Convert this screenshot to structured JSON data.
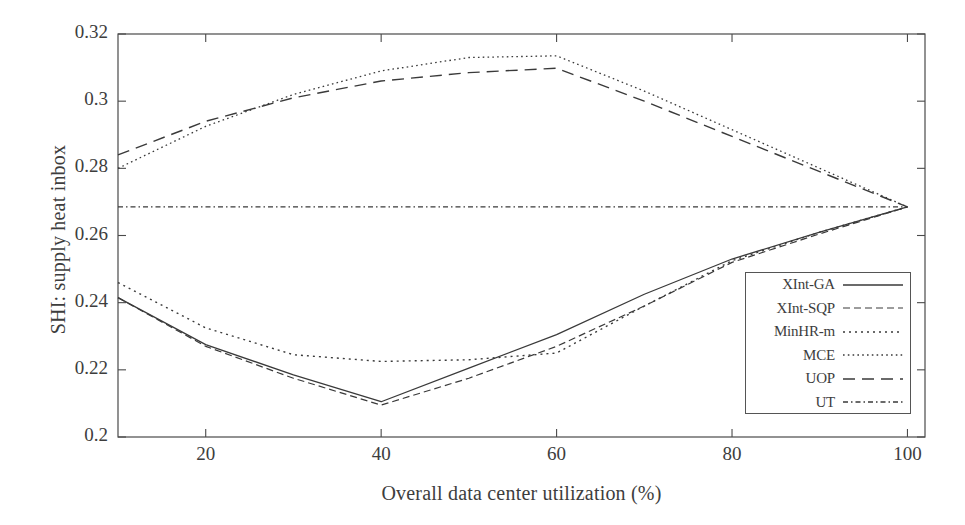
{
  "chart_data": {
    "type": "line",
    "title": "",
    "xlabel": "Overall data center utilization (%)",
    "ylabel": "SHI: supply heat inbox",
    "xlim": [
      10,
      102
    ],
    "ylim": [
      0.2,
      0.32
    ],
    "xticks": [
      20,
      40,
      60,
      80,
      100
    ],
    "yticks": [
      "0.2",
      "0.22",
      "0.24",
      "0.26",
      "0.28",
      "0.3",
      "0.32"
    ],
    "ytick_values": [
      0.2,
      0.22,
      0.24,
      0.26,
      0.28,
      0.3,
      0.32
    ],
    "grid": false,
    "legend_position": "lower-right-inside",
    "x": [
      10,
      20,
      30,
      40,
      50,
      60,
      70,
      80,
      90,
      100
    ],
    "series": [
      {
        "name": "XInt-GA",
        "style": "solid",
        "values": [
          0.2415,
          0.2275,
          0.2185,
          0.2105,
          0.2205,
          0.2305,
          0.2425,
          0.253,
          0.261,
          0.2685
        ]
      },
      {
        "name": "XInt-SQP",
        "style": "dashed",
        "values": [
          0.2415,
          0.227,
          0.2175,
          0.2095,
          0.2175,
          0.227,
          0.239,
          0.252,
          0.2605,
          0.2685
        ]
      },
      {
        "name": "MinHR-m",
        "style": "dotted",
        "values": [
          0.246,
          0.2325,
          0.2245,
          0.2225,
          0.223,
          0.225,
          0.239,
          0.2525,
          0.261,
          0.2685
        ]
      },
      {
        "name": "MCE",
        "style": "fine-dotted",
        "values": [
          0.28,
          0.2925,
          0.302,
          0.309,
          0.313,
          0.3135,
          0.303,
          0.2915,
          0.28,
          0.2685
        ]
      },
      {
        "name": "UOP",
        "style": "long-dashed",
        "values": [
          0.284,
          0.294,
          0.301,
          0.306,
          0.3085,
          0.3098,
          0.3,
          0.2895,
          0.279,
          0.2685
        ]
      },
      {
        "name": "UT",
        "style": "dash-dot",
        "values": [
          0.2685,
          0.2685,
          0.2685,
          0.2685,
          0.2685,
          0.2685,
          0.2685,
          0.2685,
          0.2685,
          0.2685
        ]
      }
    ]
  },
  "legend": {
    "entries": [
      {
        "label": "XInt-GA"
      },
      {
        "label": "XInt-SQP"
      },
      {
        "label": "MinHR-m"
      },
      {
        "label": "MCE"
      },
      {
        "label": "UOP"
      },
      {
        "label": "UT"
      }
    ]
  },
  "colors": {
    "axis": "#4a4a4a",
    "text": "#3d3d3d",
    "line": "#3a3a3a",
    "background": "#ffffff"
  }
}
